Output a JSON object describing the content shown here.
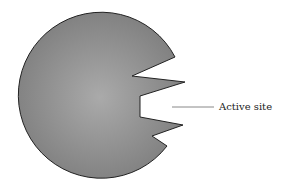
{
  "diagram": {
    "title": "",
    "shape": "enzyme",
    "labels": [
      {
        "id": "active-site",
        "text": "Active site"
      }
    ],
    "colors": {
      "fill_center": "#a9a9a9",
      "fill_edge": "#7d7d7d",
      "stroke": "#222222",
      "leader_line": "#888888"
    }
  }
}
